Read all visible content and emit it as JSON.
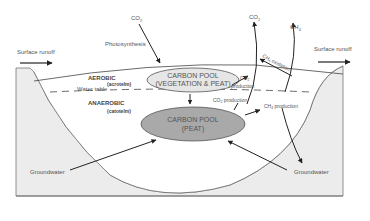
{
  "diagram": {
    "labels": {
      "co2_top_left": "CO",
      "co2_top_left_sub": "2",
      "photosynthesis": "Photosynthesis",
      "surface_runoff_left": "Surface runoff",
      "surface_runoff_right": "Surface runoff",
      "co2_top_right": "CO",
      "co2_top_right_sub": "2",
      "ch4_top": "CH",
      "ch4_top_sub": "4",
      "ch4_oxidation": "CH",
      "ch4_oxidation_sub": "4",
      "ch4_oxidation_word": " oxidation",
      "aerobic": "AEROBIC",
      "acrotelm": "(acrotelm)",
      "water_table": "Water table",
      "anaerobic": "ANAEROBIC",
      "catotelm": "(catotelm)",
      "carbon_pool_upper_line1": "CARBON POOL",
      "carbon_pool_upper_line2": "(VEGETATION & PEAT)",
      "carbon_pool_lower_line1": "CARBON POOL",
      "carbon_pool_lower_line2": "(PEAT)",
      "co2_production_upper": "CO",
      "co2_production_upper_sub": "2",
      "co2_production_upper_word": "production",
      "co2_production_lower": "CO",
      "co2_production_lower_sub": "2",
      "co2_production_lower_word": " production",
      "ch4_production": "CH",
      "ch4_production_sub": "4",
      "ch4_production_word": " production",
      "groundwater_left": "Groundwater",
      "groundwater_right": "Groundwater"
    },
    "colors": {
      "ground_fill": "#ececec",
      "upper_pool_fill": "#e6e6e6",
      "lower_pool_fill": "#a9a9a9",
      "line": "#333333"
    }
  }
}
